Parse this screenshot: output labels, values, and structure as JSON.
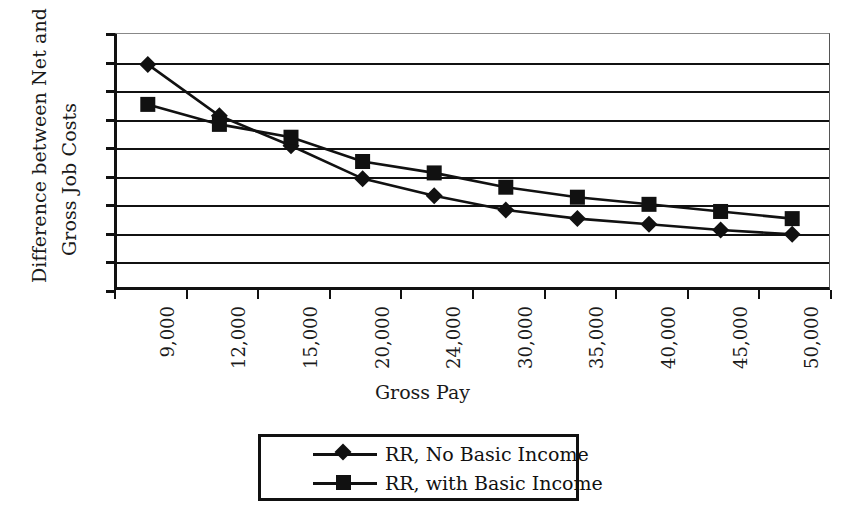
{
  "chart_data": {
    "type": "line",
    "title": "",
    "xlabel": "Gross Pay",
    "ylabel": "Difference between Net and Gross Job Costs",
    "ylabel_lines": [
      "Difference between Net and",
      "Gross Job Costs"
    ],
    "categories": [
      "9,000",
      "12,000",
      "15,000",
      "20,000",
      "24,000",
      "30,000",
      "35,000",
      "40,000",
      "45,000",
      "50,000"
    ],
    "ytick_labels": [
      "0.9",
      "0.8",
      "0.7",
      "0.6",
      "0.5",
      "0.4",
      "0.3",
      "0.2",
      "0.1",
      "0"
    ],
    "ylim": [
      0,
      0.9
    ],
    "ytick_step": 0.1,
    "grid": true,
    "legend_position": "bottom",
    "series": [
      {
        "name": "RR, No Basic Income",
        "marker": "diamond",
        "color": "#111111",
        "values": [
          0.79,
          0.61,
          0.505,
          0.39,
          0.33,
          0.28,
          0.25,
          0.23,
          0.21,
          0.195
        ]
      },
      {
        "name": "RR, with Basic Income",
        "marker": "square",
        "color": "#111111",
        "values": [
          0.65,
          0.58,
          0.535,
          0.45,
          0.41,
          0.36,
          0.325,
          0.3,
          0.275,
          0.25
        ]
      }
    ]
  },
  "legend": {
    "items": [
      {
        "label": "RR, No Basic Income",
        "marker": "diamond"
      },
      {
        "label": "RR, with Basic Income",
        "marker": "square"
      }
    ]
  }
}
